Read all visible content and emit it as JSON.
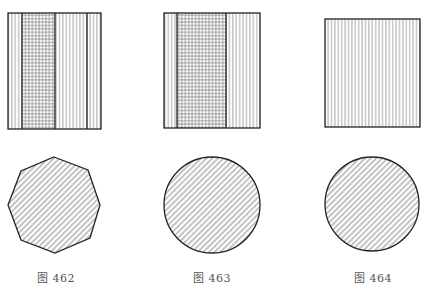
{
  "figures": [
    {
      "id": "462",
      "caption": "图 462",
      "top_view": {
        "shape": "rectangle",
        "x": 8,
        "y": 13,
        "w": 93,
        "h": 116,
        "bands": [
          {
            "x0": 8,
            "x1": 22,
            "fill": "vertical"
          },
          {
            "x0": 22,
            "x1": 55,
            "fill": "grid"
          },
          {
            "x0": 55,
            "x1": 87,
            "fill": "vertical"
          },
          {
            "x0": 87,
            "x1": 101,
            "fill": "vertical"
          }
        ],
        "divider_lines": [
          22,
          55,
          87
        ]
      },
      "bottom_view": {
        "shape": "octagon",
        "points": [
          [
            54,
            157
          ],
          [
            88,
            170
          ],
          [
            100,
            205
          ],
          [
            90,
            238
          ],
          [
            55,
            253
          ],
          [
            21,
            240
          ],
          [
            8,
            205
          ],
          [
            21,
            171
          ]
        ],
        "fill": "diagonal"
      },
      "caption_x": 37
    },
    {
      "id": "463",
      "caption": "图 463",
      "top_view": {
        "shape": "rectangle",
        "x": 164,
        "y": 13,
        "w": 96,
        "h": 115,
        "bands": [
          {
            "x0": 164,
            "x1": 177,
            "fill": "vertical"
          },
          {
            "x0": 177,
            "x1": 226,
            "fill": "grid"
          },
          {
            "x0": 226,
            "x1": 260,
            "fill": "vertical"
          }
        ],
        "divider_lines": [
          177,
          226
        ]
      },
      "bottom_view": {
        "shape": "circle",
        "cx": 212,
        "cy": 205,
        "r": 48,
        "fill": "diagonal"
      },
      "caption_x": 193
    },
    {
      "id": "464",
      "caption": "图 464",
      "top_view": {
        "shape": "rectangle",
        "x": 325,
        "y": 19,
        "w": 95,
        "h": 108,
        "bands": [
          {
            "x0": 325,
            "x1": 420,
            "fill": "vertical"
          }
        ],
        "divider_lines": []
      },
      "bottom_view": {
        "shape": "circle",
        "cx": 372,
        "cy": 204,
        "r": 47,
        "fill": "diagonal"
      },
      "caption_x": 354
    }
  ],
  "style": {
    "stroke": "#222222",
    "hatch": "#888888",
    "caption_color": "#555555"
  }
}
